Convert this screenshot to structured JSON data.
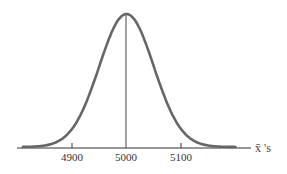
{
  "chart_data": {
    "type": "line",
    "title": "",
    "subtitle": "",
    "xlabel": "x̄ 's",
    "ylabel": "",
    "x_ticks": [
      4900,
      5000,
      5100
    ],
    "tick_labels": [
      "4900",
      "5000",
      "5100"
    ],
    "xlim": [
      4810,
      5200
    ],
    "ylim": [
      0,
      1
    ],
    "mean": 5000,
    "sd": 50,
    "grid": false,
    "legend": null,
    "center_line": {
      "x": 5000
    },
    "series": [
      {
        "name": "density",
        "x": [
          4810,
          4850,
          4875,
          4900,
          4925,
          4950,
          4975,
          5000,
          5025,
          5050,
          5075,
          5100,
          5125,
          5150,
          5190
        ],
        "values": [
          0.03,
          0.11,
          0.21,
          0.37,
          0.58,
          0.8,
          0.96,
          1.0,
          0.96,
          0.8,
          0.58,
          0.37,
          0.21,
          0.11,
          0.03
        ]
      }
    ],
    "colors": {
      "curve": "#666666",
      "axis": "#333333",
      "center_line": "#444444"
    }
  }
}
